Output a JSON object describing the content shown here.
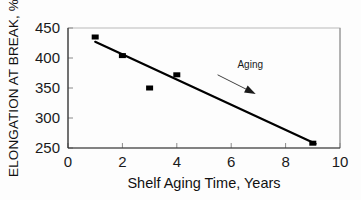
{
  "chart_data": {
    "type": "scatter",
    "title": "",
    "xlabel": "Shelf Aging Time, Years",
    "ylabel": "ELONGATION AT BREAK, %",
    "xlim": [
      0,
      10
    ],
    "ylim": [
      250,
      450
    ],
    "xticks": [
      0,
      2,
      4,
      6,
      8,
      10
    ],
    "yticks": [
      250,
      300,
      350,
      400,
      450
    ],
    "xtick_labels": [
      "0",
      "2",
      "4",
      "6",
      "8",
      "10"
    ],
    "ytick_labels": [
      "250",
      "300",
      "350",
      "400",
      "450"
    ],
    "grid": false,
    "legend": "none",
    "marker_style": "filled-square",
    "marker_color": "#000000",
    "x": [
      1,
      2,
      3,
      4,
      9
    ],
    "values": [
      435,
      404,
      350,
      372,
      258
    ],
    "series": [
      {
        "name": "Elongation at break",
        "x": [
          1,
          2,
          3,
          4,
          9
        ],
        "values": [
          435,
          404,
          350,
          372,
          258
        ]
      }
    ],
    "trendline": {
      "type": "linear",
      "x": [
        1.0,
        9.1
      ],
      "values": [
        427,
        257
      ],
      "color": "#000000"
    },
    "annotations": [
      {
        "text": "Aging",
        "x": 6.7,
        "y": 383,
        "arrow_from_x": 5.5,
        "arrow_from_y": 372,
        "arrow_to_x": 6.9,
        "arrow_to_y": 340
      }
    ]
  },
  "axes": {
    "x_title": "Shelf Aging Time, Years",
    "y_title": "ELONGATION AT BREAK, %"
  },
  "annotation": {
    "aging_label": "Aging"
  }
}
